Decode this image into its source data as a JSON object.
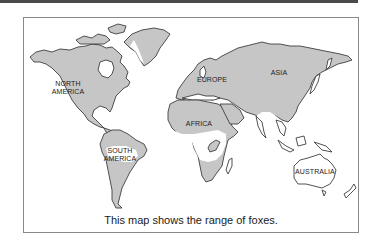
{
  "map": {
    "title": "Range of foxes world map",
    "caption": "This map shows the range of foxes.",
    "colors": {
      "fox_range": "#c6c6c6",
      "no_range": "#ffffff",
      "coastline": "#3e3e3e",
      "frame": "#8a8a8a"
    },
    "labels": {
      "north_america": [
        "NORTH",
        "AMERICA"
      ],
      "south_america": [
        "SOUTH",
        "AMERICA"
      ],
      "europe": "EUROPE",
      "africa": "AFRICA",
      "asia": "ASIA",
      "australia": "AUSTRALIA"
    }
  }
}
